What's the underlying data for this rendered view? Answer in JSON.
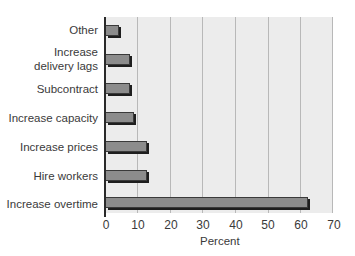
{
  "chart_data": {
    "type": "bar",
    "orientation": "horizontal",
    "title": "",
    "xlabel": "Percent",
    "ylabel": "",
    "xlim": [
      0,
      70
    ],
    "x_ticks": [
      0,
      10,
      20,
      30,
      40,
      50,
      60,
      70
    ],
    "grid": true,
    "legend": null,
    "categories": [
      "Other",
      "Increase delivery lags",
      "Subcontract",
      "Increase capacity",
      "Increase prices",
      "Hire workers",
      "Increase overtime"
    ],
    "values": [
      4,
      7.5,
      7.5,
      8.5,
      12.5,
      12.5,
      62
    ],
    "colors": {
      "bar": "#8c8c8c",
      "bar_edge": "#1e1e1e",
      "plot_bg": "#ececec",
      "grid": "#b8b8b8"
    }
  },
  "labels": {
    "cat0": "Other",
    "cat1_line1": "Increase",
    "cat1_line2": "delivery lags",
    "cat2": "Subcontract",
    "cat3": "Increase capacity",
    "cat4": "Increase prices",
    "cat5": "Hire workers",
    "cat6": "Increase overtime",
    "ticks": [
      "0",
      "10",
      "20",
      "30",
      "40",
      "50",
      "60",
      "70"
    ],
    "axis_title": "Percent"
  }
}
